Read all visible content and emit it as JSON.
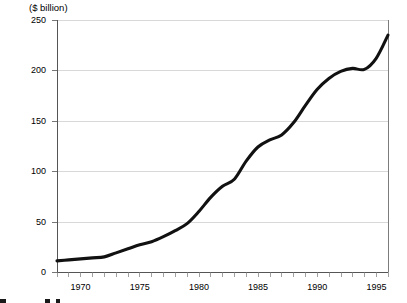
{
  "chart_data": {
    "type": "line",
    "title": "($  billion)",
    "xlabel": "",
    "ylabel": "",
    "grid": true,
    "legend": false,
    "xlim": [
      1968,
      1996
    ],
    "ylim": [
      0,
      250
    ],
    "y_ticks": [
      0,
      50,
      100,
      150,
      200,
      250
    ],
    "y_tick_labels": [
      "0",
      "50",
      "100",
      "150",
      "200",
      "250"
    ],
    "x_ticks": [
      1970,
      1975,
      1980,
      1985,
      1990,
      1995
    ],
    "x_tick_labels": [
      "1970",
      "1975",
      "1980",
      "1985",
      "1990",
      "1995"
    ],
    "x_minor_tick_step": 1,
    "series": [
      {
        "name": "value",
        "color": "#111111",
        "x": [
          1968,
          1969,
          1970,
          1971,
          1972,
          1973,
          1974,
          1975,
          1976,
          1977,
          1978,
          1979,
          1980,
          1981,
          1982,
          1983,
          1984,
          1985,
          1986,
          1987,
          1988,
          1989,
          1990,
          1991,
          1992,
          1993,
          1994,
          1995,
          1996
        ],
        "values": [
          11,
          12,
          13,
          14,
          15,
          19,
          23,
          27,
          30,
          35,
          41,
          48,
          60,
          74,
          85,
          92,
          110,
          124,
          131,
          136,
          148,
          165,
          181,
          192,
          199,
          202,
          201,
          212,
          235
        ]
      }
    ]
  },
  "axis": {
    "title_text": "($  billion)"
  }
}
